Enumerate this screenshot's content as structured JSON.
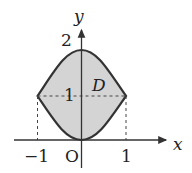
{
  "diagram": {
    "region_label": "D",
    "axes": {
      "x_label": "x",
      "y_label": "y",
      "origin_label": "O"
    },
    "ticks": {
      "x_neg": "−1",
      "x_pos": "1",
      "y_one": "1",
      "y_two": "2"
    },
    "curves": [
      {
        "name": "upper",
        "equation": "y = 2 - x^2",
        "domain": [
          -1,
          1
        ]
      },
      {
        "name": "lower",
        "equation": "y = x^2",
        "domain": [
          -1,
          1
        ]
      }
    ],
    "guide_lines": [
      "x = -1 (dashed)",
      "x = 1 (dashed)",
      "y = 1 (dashed)"
    ],
    "colors": {
      "fill": "#d4d4d4",
      "stroke": "#333333"
    }
  }
}
